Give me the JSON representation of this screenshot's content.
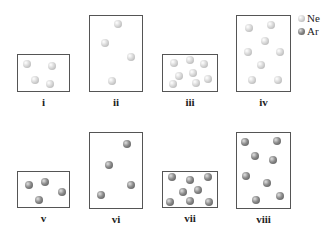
{
  "legend": [
    {
      "label": "Ne",
      "kind": "ne",
      "color": "#c8c8c8"
    },
    {
      "label": "Ar",
      "kind": "ar",
      "color": "#6e6e6e"
    }
  ],
  "containers": [
    {
      "id": "i",
      "label": "i",
      "gas": "ne",
      "box": [
        17,
        54,
        53,
        38
      ],
      "particles": [
        [
          27,
          64
        ],
        [
          52,
          66
        ],
        [
          35,
          80
        ],
        [
          50,
          84
        ]
      ]
    },
    {
      "id": "ii",
      "label": "ii",
      "gas": "ne",
      "box": [
        89,
        15,
        54,
        77
      ],
      "particles": [
        [
          118,
          24
        ],
        [
          105,
          43
        ],
        [
          131,
          57
        ],
        [
          112,
          81
        ]
      ]
    },
    {
      "id": "iii",
      "label": "iii",
      "gas": "ne",
      "box": [
        162,
        54,
        56,
        38
      ],
      "particles": [
        [
          174,
          63
        ],
        [
          190,
          60
        ],
        [
          204,
          64
        ],
        [
          179,
          76
        ],
        [
          193,
          73
        ],
        [
          208,
          79
        ],
        [
          173,
          84
        ],
        [
          196,
          83
        ]
      ]
    },
    {
      "id": "iv",
      "label": "iv",
      "gas": "ne",
      "box": [
        236,
        15,
        55,
        77
      ],
      "particles": [
        [
          249,
          28
        ],
        [
          271,
          25
        ],
        [
          265,
          41
        ],
        [
          248,
          52
        ],
        [
          280,
          52
        ],
        [
          261,
          65
        ],
        [
          252,
          80
        ],
        [
          278,
          80
        ]
      ]
    },
    {
      "id": "v",
      "label": "v",
      "gas": "ar",
      "box": [
        17,
        171,
        53,
        37
      ],
      "particles": [
        [
          29,
          185
        ],
        [
          45,
          182
        ],
        [
          62,
          192
        ],
        [
          39,
          200
        ]
      ]
    },
    {
      "id": "vi",
      "label": "vi",
      "gas": "ar",
      "box": [
        89,
        132,
        54,
        77
      ],
      "particles": [
        [
          127,
          144
        ],
        [
          109,
          165
        ],
        [
          131,
          185
        ],
        [
          101,
          195
        ]
      ]
    },
    {
      "id": "vii",
      "label": "vii",
      "gas": "ar",
      "box": [
        162,
        171,
        56,
        37
      ],
      "particles": [
        [
          172,
          177
        ],
        [
          190,
          180
        ],
        [
          208,
          177
        ],
        [
          183,
          192
        ],
        [
          198,
          190
        ],
        [
          170,
          202
        ],
        [
          190,
          201
        ],
        [
          209,
          202
        ]
      ]
    },
    {
      "id": "viii",
      "label": "viii",
      "gas": "ar",
      "box": [
        236,
        132,
        55,
        77
      ],
      "particles": [
        [
          245,
          142
        ],
        [
          277,
          141
        ],
        [
          255,
          156
        ],
        [
          273,
          160
        ],
        [
          246,
          176
        ],
        [
          267,
          183
        ],
        [
          256,
          200
        ],
        [
          280,
          196
        ]
      ]
    }
  ],
  "label_offset_y": 14
}
